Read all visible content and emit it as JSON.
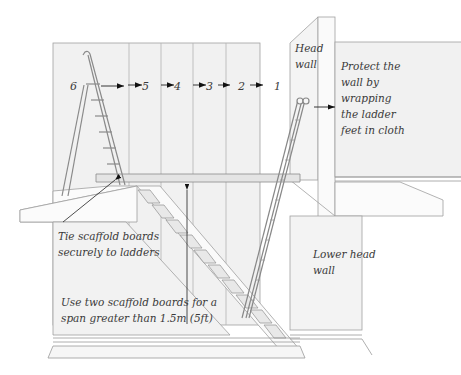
{
  "diagram": {
    "colors": {
      "background": "#ffffff",
      "wall_fill": "#f0f0f0",
      "line": "#9a9a9a",
      "text": "#3a3a3a",
      "arrow": "#111111"
    },
    "order_numbers": [
      "1",
      "2",
      "3",
      "4",
      "5",
      "6"
    ],
    "labels": {
      "head_wall": [
        "Head",
        "wall"
      ],
      "protect_wall": [
        "Protect the",
        "wall by",
        "wrapping",
        "the ladder",
        "feet in cloth"
      ],
      "tie_boards": [
        "Tie scaffold boards",
        "securely to ladders"
      ],
      "lower_head_wall": [
        "Lower head",
        "wall"
      ],
      "two_boards": [
        "Use two scaffold boards for a",
        "span greater than 1.5m (5ft)"
      ]
    },
    "components": [
      "stepladder",
      "extension-ladder",
      "scaffold-board",
      "staircase",
      "landing",
      "head-wall",
      "lower-head-wall"
    ]
  }
}
